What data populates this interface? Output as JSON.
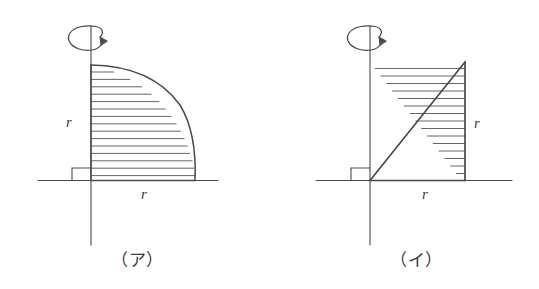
{
  "page": {
    "background_color": "#ffffff",
    "ink_color": "#4a4a4a",
    "width": 539,
    "height": 289
  },
  "figures": [
    {
      "id": "figure-a",
      "caption": "（ア）",
      "shape": "quarter-circle",
      "description": "Quarter disc of radius r in the first quadrant, hatched horizontally, rotated about the vertical axis",
      "axis_of_revolution": "vertical",
      "rotation_arrow": "curved-arrow-icon",
      "right_angle_marker": true,
      "labels": {
        "vertical_radius": "r",
        "horizontal_radius": "r"
      },
      "hatch_line_count": 14,
      "geometry": {
        "origin": [
          91,
          180
        ],
        "radius": 125,
        "vaxis_top": 26,
        "vaxis_bottom": 245,
        "haxis_left": 38,
        "haxis_right": 218
      }
    },
    {
      "id": "figure-b",
      "caption": "（イ）",
      "shape": "right-triangle",
      "description": "Right triangle with legs r along the base and r vertical at the far right, hatched horizontally, rotated about the vertical axis",
      "axis_of_revolution": "vertical",
      "rotation_arrow": "curved-arrow-icon",
      "right_angle_marker": true,
      "labels": {
        "vertical_leg": "r",
        "horizontal_leg": "r"
      },
      "hatch_line_count": 13,
      "geometry": {
        "origin": [
          370,
          180
        ],
        "apex": [
          465,
          62
        ],
        "foot": [
          465,
          180
        ],
        "vaxis_top": 26,
        "vaxis_bottom": 245,
        "haxis_left": 316,
        "haxis_right": 512
      }
    }
  ]
}
